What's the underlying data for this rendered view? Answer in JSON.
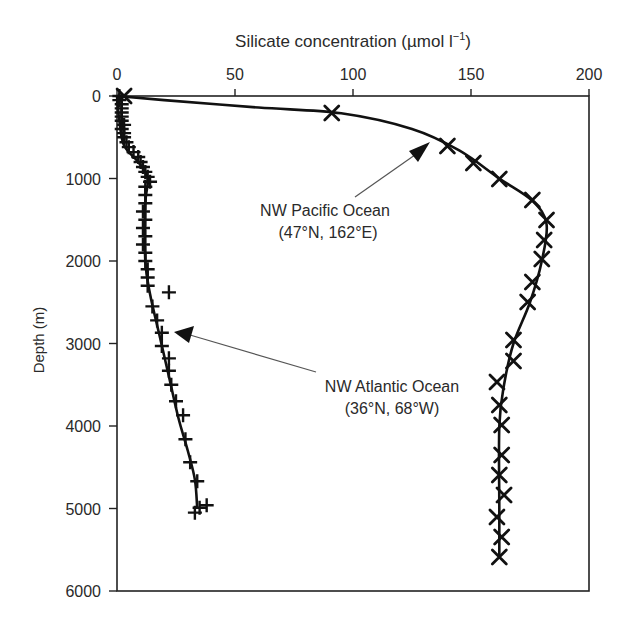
{
  "chart_data": {
    "type": "line",
    "title": "",
    "xlabel": "Silicate concentration (µmol l⁻¹)",
    "ylabel": "Depth (m)",
    "xlim": [
      0,
      200
    ],
    "ylim": [
      6000,
      0
    ],
    "x_ticks": [
      0,
      50,
      100,
      150,
      200
    ],
    "y_ticks": [
      0,
      1000,
      2000,
      3000,
      4000,
      5000,
      6000
    ],
    "x_axis_position": "top",
    "y_inverted": true,
    "grid": false,
    "legend": null,
    "series": [
      {
        "name": "NW Pacific Ocean (47°N, 162°E)",
        "marker": "x",
        "points": [
          {
            "silicate": 3,
            "depth": 0
          },
          {
            "silicate": 91,
            "depth": 205
          },
          {
            "silicate": 140,
            "depth": 606
          },
          {
            "silicate": 151,
            "depth": 812
          },
          {
            "silicate": 162,
            "depth": 1006
          },
          {
            "silicate": 176,
            "depth": 1261
          },
          {
            "silicate": 182,
            "depth": 1503
          },
          {
            "silicate": 181,
            "depth": 1745
          },
          {
            "silicate": 180,
            "depth": 1976
          },
          {
            "silicate": 176,
            "depth": 2255
          },
          {
            "silicate": 174,
            "depth": 2497
          },
          {
            "silicate": 168,
            "depth": 2958
          },
          {
            "silicate": 168,
            "depth": 3212
          },
          {
            "silicate": 161,
            "depth": 3467
          },
          {
            "silicate": 162,
            "depth": 3745
          },
          {
            "silicate": 163,
            "depth": 3988
          },
          {
            "silicate": 163,
            "depth": 4352
          },
          {
            "silicate": 162,
            "depth": 4594
          },
          {
            "silicate": 164,
            "depth": 4836
          },
          {
            "silicate": 161,
            "depth": 5103
          },
          {
            "silicate": 163,
            "depth": 5345
          },
          {
            "silicate": 162,
            "depth": 5588
          }
        ],
        "curve": [
          {
            "silicate": 0,
            "depth": 0
          },
          {
            "silicate": 20,
            "depth": 50
          },
          {
            "silicate": 60,
            "depth": 140
          },
          {
            "silicate": 95,
            "depth": 210
          },
          {
            "silicate": 125,
            "depth": 400
          },
          {
            "silicate": 145,
            "depth": 660
          },
          {
            "silicate": 162,
            "depth": 1000
          },
          {
            "silicate": 176,
            "depth": 1270
          },
          {
            "silicate": 182,
            "depth": 1550
          },
          {
            "silicate": 180,
            "depth": 2000
          },
          {
            "silicate": 175,
            "depth": 2500
          },
          {
            "silicate": 168,
            "depth": 3000
          },
          {
            "silicate": 164,
            "depth": 3500
          },
          {
            "silicate": 162,
            "depth": 4000
          },
          {
            "silicate": 162,
            "depth": 5000
          },
          {
            "silicate": 162,
            "depth": 5600
          }
        ]
      },
      {
        "name": "NW Atlantic Ocean (36°N, 68°W)",
        "marker": "+",
        "points": [
          {
            "silicate": 1,
            "depth": 0
          },
          {
            "silicate": 1,
            "depth": 50
          },
          {
            "silicate": 2,
            "depth": 100
          },
          {
            "silicate": 2,
            "depth": 150
          },
          {
            "silicate": 2,
            "depth": 200
          },
          {
            "silicate": 2,
            "depth": 250
          },
          {
            "silicate": 2,
            "depth": 300
          },
          {
            "silicate": 3,
            "depth": 350
          },
          {
            "silicate": 2,
            "depth": 400
          },
          {
            "silicate": 3,
            "depth": 450
          },
          {
            "silicate": 3,
            "depth": 500
          },
          {
            "silicate": 4,
            "depth": 560
          },
          {
            "silicate": 5,
            "depth": 620
          },
          {
            "silicate": 7,
            "depth": 680
          },
          {
            "silicate": 9,
            "depth": 740
          },
          {
            "silicate": 10,
            "depth": 800
          },
          {
            "silicate": 11,
            "depth": 860
          },
          {
            "silicate": 12,
            "depth": 920
          },
          {
            "silicate": 13,
            "depth": 980
          },
          {
            "silicate": 14,
            "depth": 1040
          },
          {
            "silicate": 12,
            "depth": 1100
          },
          {
            "silicate": 12,
            "depth": 1200
          },
          {
            "silicate": 12,
            "depth": 1300
          },
          {
            "silicate": 11,
            "depth": 1400
          },
          {
            "silicate": 12,
            "depth": 1500
          },
          {
            "silicate": 11,
            "depth": 1600
          },
          {
            "silicate": 12,
            "depth": 1700
          },
          {
            "silicate": 11,
            "depth": 1800
          },
          {
            "silicate": 12,
            "depth": 1900
          },
          {
            "silicate": 12,
            "depth": 2000
          },
          {
            "silicate": 13,
            "depth": 2100
          },
          {
            "silicate": 13,
            "depth": 2200
          },
          {
            "silicate": 13,
            "depth": 2300
          },
          {
            "silicate": 22,
            "depth": 2380
          },
          {
            "silicate": 15,
            "depth": 2550
          },
          {
            "silicate": 17,
            "depth": 2720
          },
          {
            "silicate": 19,
            "depth": 2870
          },
          {
            "silicate": 19,
            "depth": 3030
          },
          {
            "silicate": 22,
            "depth": 3180
          },
          {
            "silicate": 22,
            "depth": 3330
          },
          {
            "silicate": 23,
            "depth": 3500
          },
          {
            "silicate": 25,
            "depth": 3700
          },
          {
            "silicate": 28,
            "depth": 3870
          },
          {
            "silicate": 29,
            "depth": 4160
          },
          {
            "silicate": 31,
            "depth": 4440
          },
          {
            "silicate": 34,
            "depth": 4670
          },
          {
            "silicate": 35,
            "depth": 4990
          },
          {
            "silicate": 38,
            "depth": 4960
          },
          {
            "silicate": 33,
            "depth": 5050
          }
        ],
        "curve": [
          {
            "silicate": 0,
            "depth": 0
          },
          {
            "silicate": 1,
            "depth": 300
          },
          {
            "silicate": 3,
            "depth": 600
          },
          {
            "silicate": 9,
            "depth": 800
          },
          {
            "silicate": 13,
            "depth": 1000
          },
          {
            "silicate": 12,
            "depth": 1300
          },
          {
            "silicate": 12,
            "depth": 2000
          },
          {
            "silicate": 14,
            "depth": 2400
          },
          {
            "silicate": 18,
            "depth": 2900
          },
          {
            "silicate": 22,
            "depth": 3400
          },
          {
            "silicate": 26,
            "depth": 3900
          },
          {
            "silicate": 30,
            "depth": 4300
          },
          {
            "silicate": 33,
            "depth": 4650
          },
          {
            "silicate": 34,
            "depth": 5000
          }
        ]
      }
    ],
    "annotations": [
      {
        "text_line1": "NW Pacific Ocean",
        "text_line2": "(47°N, 162°E)",
        "arrow_to": {
          "silicate": 133,
          "depth": 520
        }
      },
      {
        "text_line1": "NW Atlantic Ocean",
        "text_line2": "(36°N, 68°W)",
        "arrow_to": {
          "silicate": 22,
          "depth": 2850
        }
      }
    ]
  },
  "labels": {
    "xlabel": "Silicate concentration (µmol l",
    "xlabel_sup": "−1",
    "xlabel_close": ")",
    "ylabel": "Depth (m)",
    "pacific_line1": "NW Pacific Ocean",
    "pacific_line2": "(47°N, 162°E)",
    "atlantic_line1": "NW Atlantic Ocean",
    "atlantic_line2": "(36°N, 68°W)"
  },
  "style": {
    "ink": "#111111",
    "axis": "#222222",
    "arrow": "#555555",
    "background": "#ffffff"
  }
}
